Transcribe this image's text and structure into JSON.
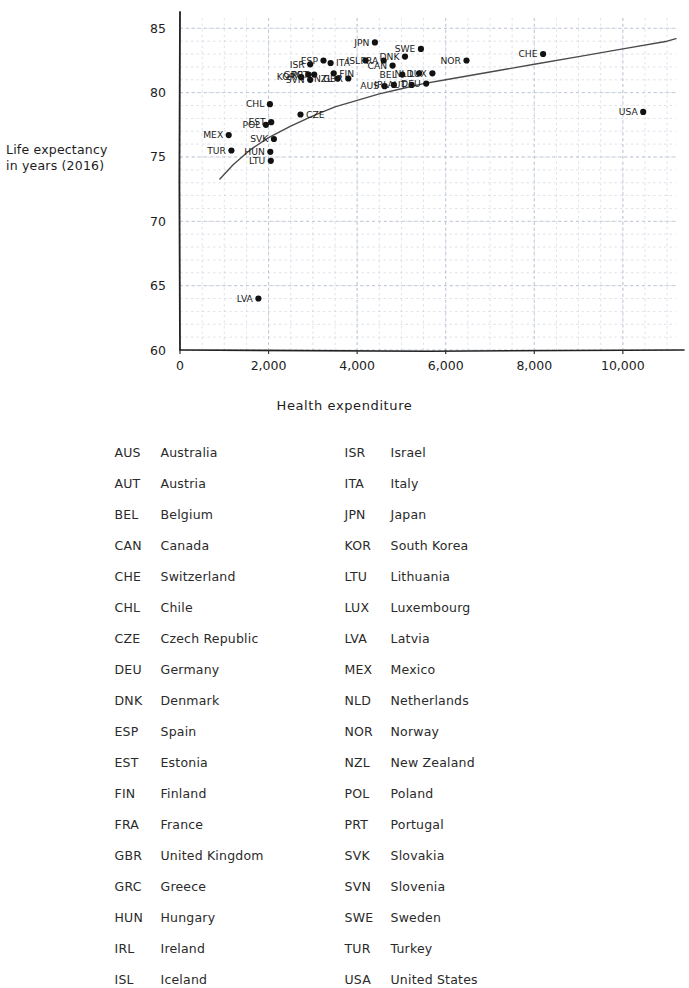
{
  "chart_data": {
    "type": "scatter",
    "title": "",
    "xlabel": "Health expenditure",
    "ylabel": "Life expectancy in years (2016)",
    "ylabel_line1": "Life expectancy",
    "ylabel_line2": "in years (2016)",
    "xlim": [
      0,
      11200
    ],
    "ylim": [
      60,
      85.8
    ],
    "xticks": [
      0,
      2000,
      4000,
      6000,
      8000,
      10000
    ],
    "xticklabels": [
      "0",
      "2,000",
      "4,000",
      "6,000",
      "8,000",
      "10,000"
    ],
    "yticks": [
      60,
      65,
      70,
      75,
      80,
      85
    ],
    "yticklabels": [
      "60",
      "65",
      "70",
      "75",
      "80",
      "85"
    ],
    "grid": true,
    "grid_color": "#b9c3d4",
    "point_color": "#111111",
    "trend_line": {
      "label": "fitted curve",
      "color": "#4a4a4a",
      "points": [
        [
          900,
          73.3
        ],
        [
          1200,
          74.4
        ],
        [
          1600,
          75.6
        ],
        [
          2000,
          76.5
        ],
        [
          2500,
          77.4
        ],
        [
          3000,
          78.2
        ],
        [
          3500,
          78.9
        ],
        [
          4000,
          79.4
        ],
        [
          4500,
          79.9
        ],
        [
          5000,
          80.3
        ],
        [
          5500,
          80.7
        ],
        [
          6000,
          81.0
        ],
        [
          7000,
          81.6
        ],
        [
          8000,
          82.2
        ],
        [
          9000,
          82.8
        ],
        [
          10000,
          83.4
        ],
        [
          11000,
          84.0
        ],
        [
          11200,
          84.2
        ]
      ]
    },
    "points": [
      {
        "code": "MEX",
        "x": 1100,
        "y": 76.7,
        "label_side": "left"
      },
      {
        "code": "TUR",
        "x": 1160,
        "y": 75.5,
        "label_side": "left"
      },
      {
        "code": "LVA",
        "x": 1770,
        "y": 64.0,
        "label_side": "left"
      },
      {
        "code": "LTU",
        "x": 2050,
        "y": 74.7,
        "label_side": "left"
      },
      {
        "code": "HUN",
        "x": 2040,
        "y": 75.4,
        "label_side": "left"
      },
      {
        "code": "CHL",
        "x": 2030,
        "y": 79.1,
        "label_side": "left"
      },
      {
        "code": "POL",
        "x": 1940,
        "y": 77.5,
        "label_side": "left"
      },
      {
        "code": "SVK",
        "x": 2120,
        "y": 76.4,
        "label_side": "left"
      },
      {
        "code": "EST",
        "x": 2060,
        "y": 77.7,
        "label_side": "left"
      },
      {
        "code": "CZE",
        "x": 2720,
        "y": 78.3,
        "label_side": "right"
      },
      {
        "code": "KOR",
        "x": 2740,
        "y": 81.2,
        "label_side": "left"
      },
      {
        "code": "GRC",
        "x": 2900,
        "y": 81.4,
        "label_side": "left"
      },
      {
        "code": "SVN",
        "x": 2940,
        "y": 81.0,
        "label_side": "left"
      },
      {
        "code": "ISR",
        "x": 2940,
        "y": 82.2,
        "label_side": "left"
      },
      {
        "code": "PRT",
        "x": 3030,
        "y": 81.4,
        "label_side": "left"
      },
      {
        "code": "ESP",
        "x": 3240,
        "y": 82.5,
        "label_side": "left"
      },
      {
        "code": "ITA",
        "x": 3400,
        "y": 82.3,
        "label_side": "right"
      },
      {
        "code": "FIN",
        "x": 3470,
        "y": 81.5,
        "label_side": "right"
      },
      {
        "code": "NZL",
        "x": 3560,
        "y": 81.1,
        "label_side": "left"
      },
      {
        "code": "GBR",
        "x": 3800,
        "y": 81.1,
        "label_side": "left"
      },
      {
        "code": "ISL",
        "x": 4190,
        "y": 82.5,
        "label_side": "left"
      },
      {
        "code": "JPN",
        "x": 4400,
        "y": 83.9,
        "label_side": "left"
      },
      {
        "code": "FRA",
        "x": 4600,
        "y": 82.5,
        "label_side": "left"
      },
      {
        "code": "AUS",
        "x": 4620,
        "y": 80.5,
        "label_side": "left"
      },
      {
        "code": "IRL",
        "x": 4830,
        "y": 80.6,
        "label_side": "left"
      },
      {
        "code": "CAN",
        "x": 4800,
        "y": 82.1,
        "label_side": "left"
      },
      {
        "code": "DNK",
        "x": 5080,
        "y": 82.8,
        "label_side": "left"
      },
      {
        "code": "BEL",
        "x": 5020,
        "y": 81.4,
        "label_side": "left"
      },
      {
        "code": "AUT",
        "x": 5230,
        "y": 80.6,
        "label_side": "left"
      },
      {
        "code": "SWE",
        "x": 5440,
        "y": 83.4,
        "label_side": "left"
      },
      {
        "code": "NLD",
        "x": 5400,
        "y": 81.5,
        "label_side": "left"
      },
      {
        "code": "DEU",
        "x": 5560,
        "y": 80.7,
        "label_side": "left"
      },
      {
        "code": "LUX",
        "x": 5700,
        "y": 81.5,
        "label_side": "left"
      },
      {
        "code": "NOR",
        "x": 6470,
        "y": 82.5,
        "label_side": "left"
      },
      {
        "code": "CHE",
        "x": 8200,
        "y": 83.0,
        "label_side": "left"
      },
      {
        "code": "USA",
        "x": 10460,
        "y": 78.5,
        "label_side": "left"
      }
    ]
  },
  "legend": {
    "left_column": [
      {
        "code": "AUS",
        "name": "Australia"
      },
      {
        "code": "AUT",
        "name": "Austria"
      },
      {
        "code": "BEL",
        "name": "Belgium"
      },
      {
        "code": "CAN",
        "name": "Canada"
      },
      {
        "code": "CHE",
        "name": "Switzerland"
      },
      {
        "code": "CHL",
        "name": "Chile"
      },
      {
        "code": "CZE",
        "name": "Czech Republic"
      },
      {
        "code": "DEU",
        "name": "Germany"
      },
      {
        "code": "DNK",
        "name": "Denmark"
      },
      {
        "code": "ESP",
        "name": "Spain"
      },
      {
        "code": "EST",
        "name": "Estonia"
      },
      {
        "code": "FIN",
        "name": "Finland"
      },
      {
        "code": "FRA",
        "name": "France"
      },
      {
        "code": "GBR",
        "name": "United Kingdom"
      },
      {
        "code": "GRC",
        "name": "Greece"
      },
      {
        "code": "HUN",
        "name": "Hungary"
      },
      {
        "code": "IRL",
        "name": "Ireland"
      },
      {
        "code": "ISL",
        "name": "Iceland"
      }
    ],
    "right_column": [
      {
        "code": "ISR",
        "name": "Israel"
      },
      {
        "code": "ITA",
        "name": "Italy"
      },
      {
        "code": "JPN",
        "name": "Japan"
      },
      {
        "code": "KOR",
        "name": "South Korea"
      },
      {
        "code": "LTU",
        "name": "Lithuania"
      },
      {
        "code": "LUX",
        "name": "Luxembourg"
      },
      {
        "code": "LVA",
        "name": "Latvia"
      },
      {
        "code": "MEX",
        "name": "Mexico"
      },
      {
        "code": "NLD",
        "name": "Netherlands"
      },
      {
        "code": "NOR",
        "name": "Norway"
      },
      {
        "code": "NZL",
        "name": "New Zealand"
      },
      {
        "code": "POL",
        "name": "Poland"
      },
      {
        "code": "PRT",
        "name": "Portugal"
      },
      {
        "code": "SVK",
        "name": "Slovakia"
      },
      {
        "code": "SVN",
        "name": "Slovenia"
      },
      {
        "code": "SWE",
        "name": "Sweden"
      },
      {
        "code": "TUR",
        "name": "Turkey"
      },
      {
        "code": "USA",
        "name": "United States"
      }
    ]
  }
}
